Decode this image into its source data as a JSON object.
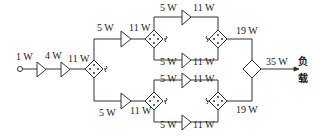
{
  "diagram": {
    "type": "power amplifier combining network",
    "input": {
      "power": "1 W"
    },
    "stages": [
      {
        "id": "amp1",
        "output": "4 W"
      },
      {
        "id": "amp2",
        "output": "11 W"
      }
    ],
    "splitter_main": {
      "input": "11 W"
    },
    "branches": {
      "upper": {
        "drive": "5 W",
        "driver_out": "11 W",
        "sub": [
          {
            "drive": "5 W",
            "out": "11 W"
          },
          {
            "drive": "5 W",
            "out": "11 W"
          }
        ],
        "combined": "19 W"
      },
      "lower": {
        "drive": "5 W",
        "driver_out": "11 W",
        "sub": [
          {
            "drive": "5 W",
            "out": "11 W"
          },
          {
            "drive": "5 W",
            "out": "11 W"
          }
        ],
        "combined": "19 W"
      }
    },
    "output": {
      "power": "35 W",
      "load_label_1": "负",
      "load_label_2": "载"
    }
  },
  "colors": {
    "line": "#333333",
    "text": "#222222",
    "background": "#ffffff"
  }
}
